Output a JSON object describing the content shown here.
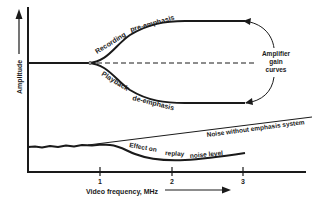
{
  "diagram": {
    "y_axis_label": "Amplitude",
    "x_axis_label": "Video frequency, MHz",
    "x_ticks": [
      "1",
      "2",
      "3"
    ],
    "curves": {
      "recording": {
        "label_word1": "Recording",
        "label_word2": "pre-emphasis"
      },
      "playback": {
        "label_word1": "Playback",
        "label_word2": "de-emphasis"
      }
    },
    "amplifier_label": {
      "line1": "Amplifier",
      "line2": "gain",
      "line3": "curves"
    },
    "noise_without": "Noise without emphasis system",
    "effect_on_replay": {
      "part1": "Effect on",
      "part2": "replay",
      "part3": "noise level"
    },
    "colors": {
      "ink": "#1a1a1a",
      "background": "#ffffff"
    }
  }
}
